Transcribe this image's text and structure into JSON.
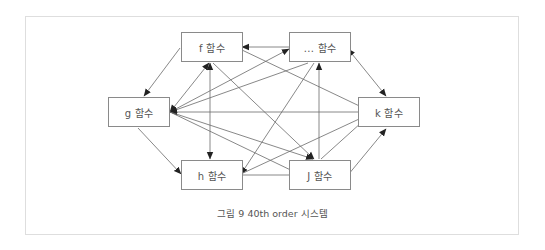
{
  "diagram": {
    "nodes": [
      {
        "id": "f",
        "label": "f 함수"
      },
      {
        "id": "dots",
        "label": "... 함수"
      },
      {
        "id": "g",
        "label": "g 함수"
      },
      {
        "id": "k",
        "label": "k 함수"
      },
      {
        "id": "h",
        "label": "h 함수"
      },
      {
        "id": "j",
        "label": "J 함수"
      }
    ],
    "edges": [
      {
        "from": "f",
        "to": "g"
      },
      {
        "from": "g",
        "to": "h"
      },
      {
        "from": "h",
        "to": "j"
      },
      {
        "from": "j",
        "to": "k"
      },
      {
        "from": "f",
        "to": "dots",
        "bidirectional": true
      },
      {
        "from": "dots",
        "to": "k",
        "bidirectional": true
      },
      {
        "from": "f",
        "to": "h",
        "bidirectional": true
      },
      {
        "from": "j",
        "to": "dots"
      },
      {
        "from": "g",
        "to": "k",
        "bidirectional": true
      },
      {
        "from": "g",
        "to": "f",
        "bidirectional": true
      },
      {
        "from": "g",
        "to": "dots",
        "bidirectional": true
      },
      {
        "from": "dots",
        "to": "g"
      },
      {
        "from": "g",
        "to": "j",
        "bidirectional": true
      },
      {
        "from": "f",
        "to": "k"
      },
      {
        "from": "f",
        "to": "j"
      },
      {
        "from": "dots",
        "to": "h"
      },
      {
        "from": "dots",
        "to": "j"
      },
      {
        "from": "h",
        "to": "k"
      },
      {
        "from": "j",
        "to": "k"
      },
      {
        "from": "dots",
        "to": "k"
      }
    ],
    "caption": "그림 9 40th order 시스템"
  }
}
